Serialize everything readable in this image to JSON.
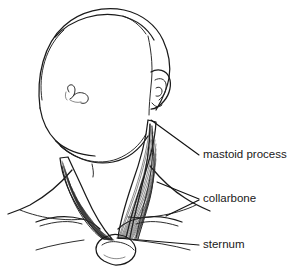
{
  "figure": {
    "view": "anterior view from below",
    "background_color": "#ffffff",
    "line_color": "#1a1a1a",
    "text_color": "#202020",
    "style": "black and white line drawing"
  },
  "labels": [
    {
      "id": "mastoid-process",
      "text": "mastoid process",
      "text_x": 203,
      "text_y": 155,
      "leader_start_x": 151,
      "leader_start_y": 120,
      "leader_end_x": 199,
      "leader_end_y": 155
    },
    {
      "id": "collarbone",
      "text": "collarbone",
      "text_x": 203,
      "text_y": 199,
      "leader_start_x": 157,
      "leader_start_y": 182,
      "leader_end_x": 199,
      "leader_end_y": 199
    },
    {
      "id": "sternum",
      "text": "sternum",
      "text_x": 203,
      "text_y": 245,
      "leader_start_x": 117,
      "leader_start_y": 238,
      "leader_end_x": 199,
      "leader_end_y": 245
    }
  ],
  "anatomy_parts": [
    {
      "id": "cranium",
      "name": "cranium"
    },
    {
      "id": "hairline",
      "name": "hairline"
    },
    {
      "id": "right-ear",
      "name": "right ear"
    },
    {
      "id": "left-ear",
      "name": "left ear"
    },
    {
      "id": "jaw-chin",
      "name": "jaw and chin"
    },
    {
      "id": "thyroid-notch",
      "name": "thyroid notch"
    },
    {
      "id": "scm-left",
      "name": "left sternocleidomastoid muscle"
    },
    {
      "id": "scm-right",
      "name": "right sternocleidomastoid muscle"
    },
    {
      "id": "clavicle-left",
      "name": "left clavicle"
    },
    {
      "id": "clavicle-right",
      "name": "right clavicle"
    },
    {
      "id": "shoulder-left",
      "name": "left shoulder"
    },
    {
      "id": "shoulder-right",
      "name": "right shoulder"
    },
    {
      "id": "sternum-manubrium",
      "name": "sternum manubrium"
    },
    {
      "id": "torso-outline",
      "name": "upper torso outline"
    }
  ]
}
